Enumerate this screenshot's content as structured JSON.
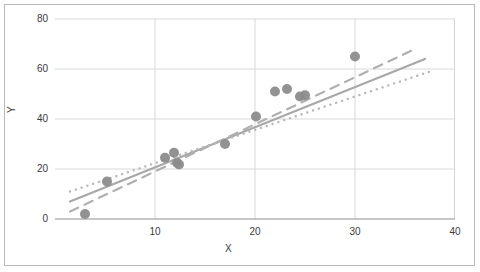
{
  "chart_data": {
    "type": "scatter",
    "title": "",
    "xlabel": "X",
    "ylabel": "Y",
    "xlim": [
      0,
      40
    ],
    "ylim": [
      0,
      80
    ],
    "xticks": [
      10,
      20,
      30,
      40
    ],
    "yticks": [
      0,
      20,
      40,
      60,
      80
    ],
    "grid": true,
    "grid_color": "#d9d9d9",
    "legend": "none",
    "marker_color": "#8c8c8c",
    "marker_size": 5,
    "points": [
      {
        "x": 3.0,
        "y": 2.0
      },
      {
        "x": 5.2,
        "y": 15.0
      },
      {
        "x": 11.0,
        "y": 24.5
      },
      {
        "x": 11.9,
        "y": 26.5
      },
      {
        "x": 12.2,
        "y": 22.5
      },
      {
        "x": 12.4,
        "y": 21.8
      },
      {
        "x": 17.0,
        "y": 30.0
      },
      {
        "x": 20.1,
        "y": 41.0
      },
      {
        "x": 22.0,
        "y": 51.0
      },
      {
        "x": 23.2,
        "y": 52.0
      },
      {
        "x": 24.5,
        "y": 49.0
      },
      {
        "x": 25.0,
        "y": 49.5
      },
      {
        "x": 30.0,
        "y": 65.0
      }
    ],
    "trendlines": [
      {
        "name": "solid-trendline",
        "style": "solid",
        "color": "#a8a8a8",
        "width": 2.2,
        "x0": 1.5,
        "y0": 7.0,
        "x1": 37.0,
        "y1": 64.0
      },
      {
        "name": "dashed-trendline",
        "style": "dashed",
        "color": "#b0b0b0",
        "width": 2.2,
        "x0": 1.5,
        "y0": 3.0,
        "x1": 36.0,
        "y1": 68.0
      },
      {
        "name": "dotted-trendline",
        "style": "dotted",
        "color": "#b8b8b8",
        "width": 2.4,
        "x0": 1.5,
        "y0": 11.0,
        "x1": 37.5,
        "y1": 59.0
      }
    ]
  },
  "axis": {
    "y_labels": [
      "80",
      "60",
      "40",
      "20",
      "0"
    ],
    "x_labels": [
      "10",
      "20",
      "30",
      "40"
    ],
    "y_title": "Y",
    "x_title": "X"
  }
}
